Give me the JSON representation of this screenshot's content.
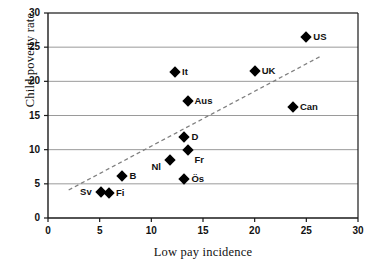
{
  "chart_data": {
    "type": "scatter",
    "title": "",
    "xlabel": "Low pay incidence",
    "ylabel": "Child poverty rate",
    "xlim": [
      0,
      30
    ],
    "ylim": [
      0,
      30
    ],
    "xticks": [
      0,
      5,
      10,
      15,
      20,
      25,
      30
    ],
    "yticks": [
      0,
      5,
      10,
      15,
      20,
      25,
      30
    ],
    "grid": "horizontal",
    "legend": "none",
    "marker_style": "filled-diamond",
    "marker_color": "#000000",
    "points": [
      {
        "label": "US",
        "x": 25.0,
        "y": 26.5,
        "label_pos": "right"
      },
      {
        "label": "UK",
        "x": 20.0,
        "y": 21.5,
        "label_pos": "right"
      },
      {
        "label": "It",
        "x": 12.3,
        "y": 21.3,
        "label_pos": "right"
      },
      {
        "label": "Aus",
        "x": 13.5,
        "y": 17.1,
        "label_pos": "right"
      },
      {
        "label": "Can",
        "x": 23.7,
        "y": 16.2,
        "label_pos": "right"
      },
      {
        "label": "D",
        "x": 13.2,
        "y": 11.8,
        "label_pos": "right"
      },
      {
        "label": "Fr",
        "x": 13.5,
        "y": 9.9,
        "label_pos": "below-right"
      },
      {
        "label": "Nl",
        "x": 11.8,
        "y": 8.5,
        "label_pos": "below-left"
      },
      {
        "label": "B",
        "x": 7.2,
        "y": 6.2,
        "label_pos": "right"
      },
      {
        "label": "Ös",
        "x": 13.2,
        "y": 5.7,
        "label_pos": "right"
      },
      {
        "label": "Sv",
        "x": 5.1,
        "y": 3.8,
        "label_pos": "left"
      },
      {
        "label": "Fi",
        "x": 5.9,
        "y": 3.6,
        "label_pos": "right"
      }
    ],
    "trendline": {
      "style": "dashed",
      "color": "#808080",
      "x0": 2.0,
      "y0": 4.1,
      "x1": 26.3,
      "y1": 23.6
    }
  }
}
